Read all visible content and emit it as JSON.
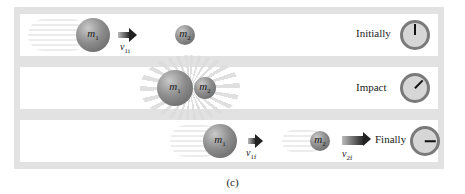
{
  "figure": {
    "caption": "(c)",
    "panels": [
      {
        "stage_label": "Initially",
        "clock_hand_deg": 0,
        "mass1": {
          "symbol": "m",
          "subscript": "1"
        },
        "mass2": {
          "symbol": "m",
          "subscript": "2"
        },
        "velocity": {
          "symbol": "v",
          "subscript": "1i"
        }
      },
      {
        "stage_label": "Impact",
        "clock_hand_deg": 45,
        "mass1": {
          "symbol": "m",
          "subscript": "1"
        },
        "mass2": {
          "symbol": "m",
          "subscript": "2"
        }
      },
      {
        "stage_label": "Finally",
        "clock_hand_deg": 90,
        "mass1": {
          "symbol": "m",
          "subscript": "1"
        },
        "mass2": {
          "symbol": "m",
          "subscript": "2"
        },
        "velocity1": {
          "symbol": "v",
          "subscript": "1f"
        },
        "velocity2": {
          "symbol": "v",
          "subscript": "2f"
        }
      }
    ]
  }
}
